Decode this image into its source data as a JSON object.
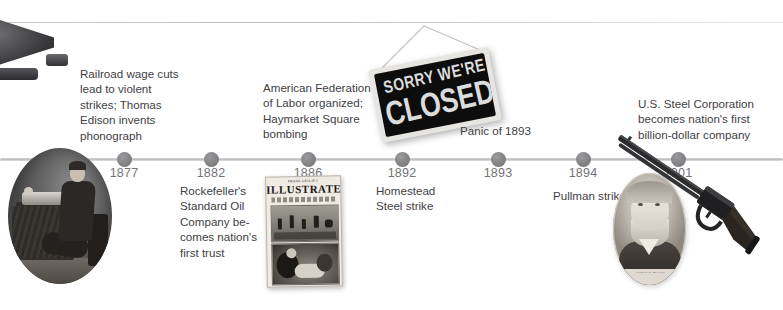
{
  "page": {
    "kind": "history-timeline",
    "background_color": "#ffffff",
    "axis_color": "#c4c4c8",
    "node_color": "#7d7d82",
    "year_label_color": "#737378",
    "caption_color": "#414145"
  },
  "timeline": {
    "events": [
      {
        "year": "1877",
        "x": 124,
        "caption": "Railroad wage cuts lead to violent strikes; Thomas Edison invents phonograph",
        "caption_side": "above"
      },
      {
        "year": "1882",
        "x": 211,
        "caption": "Rockefeller's Standard Oil Company be-comes nation's first trust",
        "caption_side": "below"
      },
      {
        "year": "1886",
        "x": 308,
        "caption": "American Federation of Labor organized; Haymarket Square bombing",
        "caption_side": "above"
      },
      {
        "year": "1892",
        "x": 402,
        "caption": "Homestead Steel strike",
        "caption_side": "below"
      },
      {
        "year": "1893",
        "x": 498,
        "caption": "Panic of 1893",
        "caption_side": "above"
      },
      {
        "year": "1894",
        "x": 583,
        "caption": "Pullman strike",
        "caption_side": "below"
      },
      {
        "year": "1901",
        "x": 678,
        "caption": "U.S. Steel Corporation becomes nation's first billion-dollar company",
        "caption_side": "above"
      }
    ]
  },
  "captions": {
    "c1877": "Railroad wage cuts\nlead to violent\nstrikes; Thomas\nEdison invents\nphonograph",
    "c1882": "Rockefeller's\nStandard Oil\nCompany be-\ncomes nation's\nfirst trust",
    "c1886": "American Federation\nof Labor organized;\nHaymarket Square\nbombing",
    "c1892": "Homestead\nSteel strike",
    "c1893": "Panic of 1893",
    "c1894": "Pullman strike",
    "c1901": "U.S. Steel Corporation\nbecomes nation's first\nbillion-dollar company"
  },
  "images": {
    "phonograph_horn": {
      "name": "phonograph-horn-photo",
      "alt": "Black phonograph horn, cropped at top-left corner"
    },
    "edison_photo": {
      "name": "edison-phonograph-photo",
      "alt": "Circular black-and-white photo of Thomas Edison seated beside his phonograph on a draped table"
    },
    "newspaper": {
      "name": "frank-leslies-illustrated-cover",
      "masthead_small": "FRANK LESLIE'S",
      "masthead": "ILLUSTRATED",
      "alt": "Frank Leslie's Illustrated newspaper cover showing the Haymarket Square bombing"
    },
    "closed_sign": {
      "name": "sorry-were-closed-sign",
      "line1": "SORRY WE'RE",
      "line2": "CLOSED",
      "alt": "Black 'Sorry We're Closed' hanging sign, tilted, on a string"
    },
    "portrait": {
      "name": "industrialist-portrait",
      "caption_line1": "ANDREW W. MELLON",
      "caption_line2": "ONE BILLION-DOLLAR STEEL",
      "alt": "Oval engraved portrait of a bearded 19th-century industrialist"
    },
    "rifle": {
      "name": "winchester-rifle-photo",
      "alt": "Lever-action Winchester rifle angled diagonally across the lower right"
    }
  }
}
